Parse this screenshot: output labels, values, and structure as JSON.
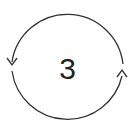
{
  "diagram": {
    "type": "cycle-arrow",
    "label": "3",
    "stroke_color": "#333333",
    "text_color": "#222222",
    "background": "#ffffff",
    "arrows": [
      {
        "position": "left",
        "direction": "down"
      },
      {
        "position": "right",
        "direction": "up"
      }
    ]
  }
}
